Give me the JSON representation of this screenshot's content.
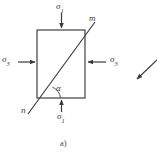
{
  "figure": {
    "caption": "a)",
    "background_color": "#ffffff",
    "line_color": "#3a3a3a",
    "description_type": "stress-element-diagram",
    "element": {
      "name": "rectangular-stress-element",
      "x": 37,
      "y": 30,
      "width": 48,
      "height": 68
    },
    "labels": {
      "sigma1_top": {
        "symbol": "σ",
        "subscript": "1"
      },
      "sigma1_bottom": {
        "symbol": "σ",
        "subscript": "1"
      },
      "sigma3_left": {
        "symbol": "σ",
        "subscript": "3"
      },
      "sigma3_right": {
        "symbol": "σ",
        "subscript": "3"
      },
      "plane_m": "m",
      "plane_n": "n",
      "angle_alpha": "α"
    },
    "arrows": [
      {
        "name": "sigma1-top-arrow",
        "direction": "down",
        "x1": 61,
        "y1": 13,
        "x2": 61,
        "y2": 28
      },
      {
        "name": "sigma1-bottom-arrow",
        "direction": "up",
        "x1": 61,
        "y1": 112,
        "x2": 61,
        "y2": 100
      },
      {
        "name": "sigma3-left-arrow",
        "direction": "right",
        "x1": 17,
        "y1": 62,
        "x2": 35,
        "y2": 62
      },
      {
        "name": "sigma3-right-arrow",
        "direction": "left",
        "x1": 106,
        "y1": 62,
        "x2": 87,
        "y2": 62
      },
      {
        "name": "adjacent-figure-arrow",
        "direction": "down-left",
        "x1": 157,
        "y1": 60,
        "x2": 136,
        "y2": 80
      }
    ],
    "failure_plane": {
      "name": "failure-plane-mn",
      "from_label": "n",
      "to_label": "m",
      "x1": 28,
      "y1": 114,
      "x2": 95,
      "y2": 22
    },
    "angle_arc": {
      "name": "alpha-angle-arc",
      "vertex_x": 47,
      "vertex_y": 98,
      "radius": 13
    }
  }
}
